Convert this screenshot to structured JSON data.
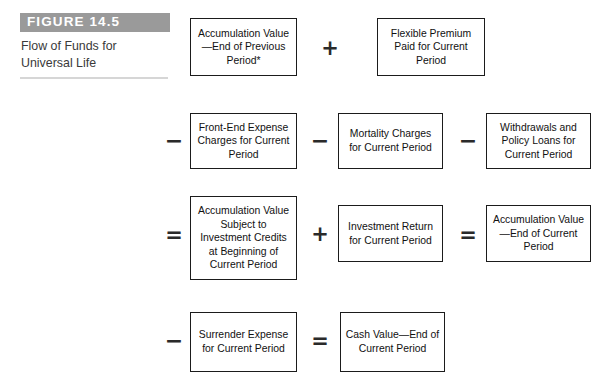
{
  "figure": {
    "banner_label": "FIGURE 14.5",
    "caption_line_1": "Flow of Funds for",
    "caption_line_2": "Universal Life",
    "banner_color": "#9a9a9a",
    "rule_color": "#d6d6d6",
    "box_border_color": "#1b1b1b",
    "text_color": "#111111"
  },
  "diagram": {
    "type": "flow-equation",
    "rows": [
      {
        "id": "row-1",
        "items": [
          {
            "kind": "box",
            "id": "accumulation-value-end-previous",
            "text": "Accumulation Value—End of Previous Period*"
          },
          {
            "kind": "operator",
            "id": "op-plus-1",
            "symbol": "+",
            "name": "plus"
          },
          {
            "kind": "box",
            "id": "flexible-premium-paid",
            "text": "Flexible Premium Paid for Current Period"
          }
        ]
      },
      {
        "id": "row-2",
        "items": [
          {
            "kind": "operator",
            "id": "op-minus-1",
            "symbol": "−",
            "name": "minus"
          },
          {
            "kind": "box",
            "id": "front-end-expense-charges",
            "text": "Front-End Expense Charges for Current Period"
          },
          {
            "kind": "operator",
            "id": "op-minus-2",
            "symbol": "−",
            "name": "minus"
          },
          {
            "kind": "box",
            "id": "mortality-charges",
            "text": "Mortality Charges for Current Period"
          },
          {
            "kind": "operator",
            "id": "op-minus-3",
            "symbol": "−",
            "name": "minus"
          },
          {
            "kind": "box",
            "id": "withdrawals-and-policy-loans",
            "text": "Withdrawals and Policy Loans for Current Period"
          }
        ]
      },
      {
        "id": "row-3",
        "items": [
          {
            "kind": "operator",
            "id": "op-equals-1",
            "symbol": "=",
            "name": "equals"
          },
          {
            "kind": "box",
            "id": "accumulation-value-subject-to-credits",
            "text": "Accumulation Value Subject to Investment Credits at Beginning of Current Period"
          },
          {
            "kind": "operator",
            "id": "op-plus-2",
            "symbol": "+",
            "name": "plus"
          },
          {
            "kind": "box",
            "id": "investment-return",
            "text": "Investment Return for Current Period"
          },
          {
            "kind": "operator",
            "id": "op-equals-2",
            "symbol": "=",
            "name": "equals"
          },
          {
            "kind": "box",
            "id": "accumulation-value-end-current",
            "text": "Accumulation Value—End of Current Period"
          }
        ]
      },
      {
        "id": "row-4",
        "items": [
          {
            "kind": "operator",
            "id": "op-minus-4",
            "symbol": "−",
            "name": "minus"
          },
          {
            "kind": "box",
            "id": "surrender-expense",
            "text": "Surrender Expense for Current Period"
          },
          {
            "kind": "operator",
            "id": "op-equals-3",
            "symbol": "=",
            "name": "equals"
          },
          {
            "kind": "box",
            "id": "cash-value-end-current",
            "text": "Cash Value—End of Current Period"
          }
        ]
      }
    ],
    "boxes": {
      "accumulation_value_end_previous": "Accumulation Value—End of Previous Period*",
      "flexible_premium_paid": "Flexible Premium Paid for Current Period",
      "front_end_expense_charges": "Front-End Expense Charges for Current Period",
      "mortality_charges": "Mortality Charges for Current Period",
      "withdrawals_and_policy_loans": "Withdrawals and Policy Loans for Current Period",
      "accumulation_value_subject_to_credits": "Accumulation Value Subject to Investment Credits at Beginning of Current Period",
      "investment_return": "Investment Return for Current Period",
      "accumulation_value_end_current": "Accumulation Value—End of Current Period",
      "surrender_expense": "Surrender Expense for Current Period",
      "cash_value_end_current": "Cash Value—End of Current Period"
    },
    "operators": {
      "plus_1": "+",
      "minus_1": "−",
      "minus_2": "−",
      "minus_3": "−",
      "equals_1": "=",
      "plus_2": "+",
      "equals_2": "=",
      "minus_4": "−",
      "equals_3": "="
    }
  }
}
